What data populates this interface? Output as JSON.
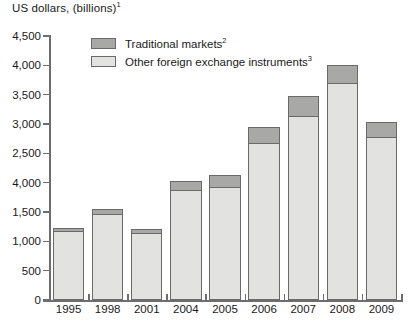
{
  "chart_data": {
    "type": "bar",
    "title": "US dollars, (billions)",
    "title_superscript": "1",
    "xlabel": "",
    "ylabel": "",
    "ylim": [
      0,
      4500
    ],
    "ytick_step": 500,
    "grid": false,
    "stacked": true,
    "legend_position": "top-left-inside",
    "categories": [
      "1995",
      "1998",
      "2001",
      "2004",
      "2005",
      "2006",
      "2007",
      "2008",
      "2009"
    ],
    "ytick_labels": [
      "4,500",
      "4,000",
      "3,500",
      "3,000",
      "2,500",
      "4,000",
      "1,500",
      "1,000",
      "500",
      "0"
    ],
    "ytick_values": [
      4500,
      4000,
      3500,
      3000,
      2500,
      2000,
      1500,
      1000,
      500,
      0
    ],
    "series": [
      {
        "name": "Other foreign exchange instruments",
        "superscript": "3",
        "color": "#e2e2e0",
        "values": [
          1180,
          1460,
          1150,
          1880,
          1920,
          2680,
          3140,
          3700,
          2780
        ]
      },
      {
        "name": "Traditional markets",
        "superscript": "2",
        "color": "#a8a8a6",
        "values": [
          70,
          110,
          80,
          160,
          230,
          280,
          350,
          330,
          270
        ]
      }
    ],
    "totals": [
      1250,
      1570,
      1230,
      2040,
      2150,
      2960,
      3490,
      4030,
      3050
    ]
  },
  "legend": {
    "items": [
      {
        "label": "Traditional markets",
        "superscript": "2",
        "swatch": "trad"
      },
      {
        "label": "Other foreign exchange instruments",
        "superscript": "3",
        "swatch": "other"
      }
    ]
  },
  "colors": {
    "traditional": "#a8a8a6",
    "other": "#e2e2e0",
    "axis": "#6d6d6d",
    "outline": "#6a6a6a",
    "text": "#1a1a1a",
    "background": "#ffffff"
  }
}
